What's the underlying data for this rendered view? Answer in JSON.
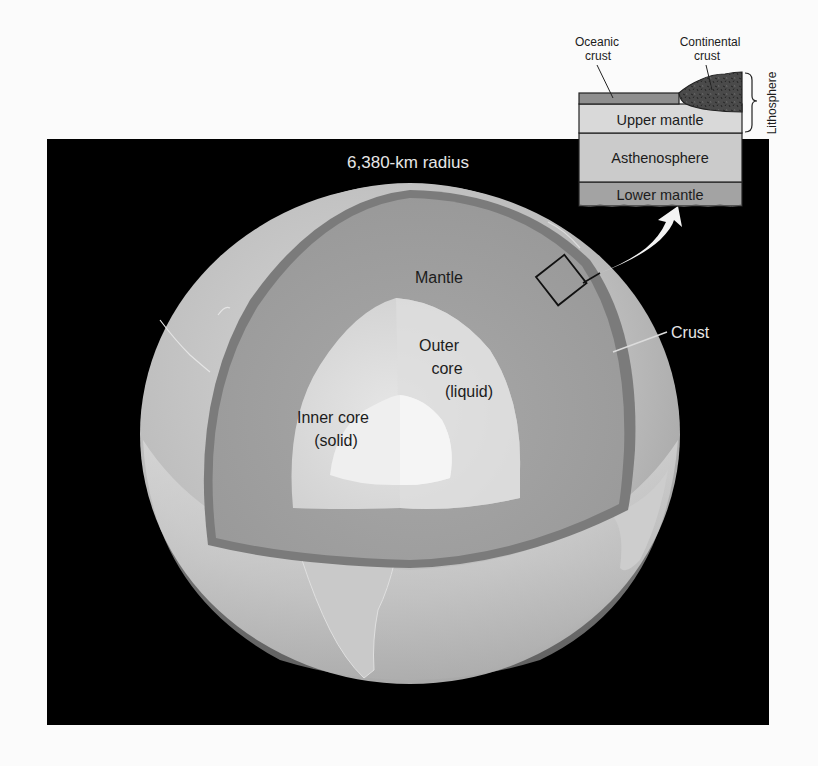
{
  "diagram": {
    "radius_label": "6,380-km radius",
    "layers": {
      "crust": "Crust",
      "mantle": "Mantle",
      "outer_core": [
        "Outer",
        "core",
        "(liquid)"
      ],
      "inner_core": [
        "Inner core",
        "(solid)"
      ]
    },
    "inset": {
      "oceanic_crust": [
        "Oceanic",
        "crust"
      ],
      "continental_crust": [
        "Continental",
        "crust"
      ],
      "lithosphere": "Lithosphere",
      "upper_mantle": "Upper mantle",
      "asthenosphere": "Asthenosphere",
      "lower_mantle": "Lower mantle"
    },
    "colors": {
      "page_bg": "#fbfbfb",
      "panel_bg": "#000000",
      "globe_surface": "#c2c2c2",
      "crust_band": "#7d7d7d",
      "mantle": "#9e9e9e",
      "outer_core": "#d9d9d9",
      "inner_core": "#eeeeee",
      "oceanic_crust": "#8f8f8f",
      "continental_crust": "#4a4a4a",
      "upper_mantle": "#d8d8d8",
      "asthenosphere": "#cacaca",
      "lower_mantle": "#a3a3a3"
    }
  }
}
